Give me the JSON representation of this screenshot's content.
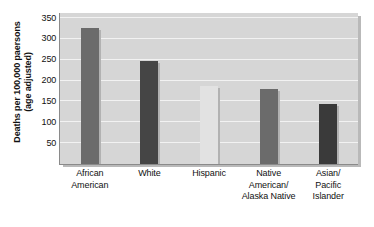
{
  "chart_data": {
    "type": "bar",
    "title": "",
    "subtitle": "",
    "xlabel": "",
    "ylabel": "Deaths per 100,000 paersons (age adjusted)",
    "ylabel_lines": [
      "Deaths per 100,000 paersons",
      "(age adjusted)"
    ],
    "categories": [
      "African American",
      "White",
      "Hispanic",
      "Native American/ Alaska Native",
      "Asian/ Pacific Islander"
    ],
    "category_lines": [
      [
        "African",
        "American"
      ],
      [
        "White"
      ],
      [
        "Hispanic"
      ],
      [
        "Native",
        "American/",
        "Alaska Native"
      ],
      [
        "Asian/",
        "Pacific",
        "Islander"
      ]
    ],
    "values": [
      325,
      247,
      188,
      180,
      143
    ],
    "bar_colors": [
      "#6b6b6b",
      "#454545",
      "#e2e2e2",
      "#6b6b6b",
      "#3a3a3a"
    ],
    "ylim": [
      0,
      362
    ],
    "yticks": [
      350,
      300,
      250,
      200,
      150,
      100,
      50
    ],
    "ytick_labels": [
      "350",
      "300",
      "250",
      "200",
      "150",
      "100",
      "50"
    ],
    "grid": true,
    "grid_color": "#f2f2f2",
    "legend": "none",
    "legend_position": "none",
    "plot_background": "#d6d6d6",
    "axis_color": "#8a8a8a",
    "text_color": "#111111"
  }
}
